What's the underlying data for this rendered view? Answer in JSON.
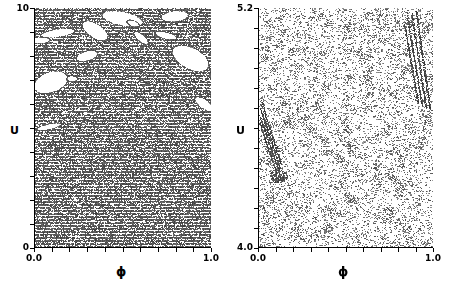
{
  "figure": {
    "width": 451,
    "height": 292,
    "background": "#ffffff",
    "ink_color": "#000000",
    "panel_count": 2
  },
  "chart_data": [
    {
      "id": "left-panel",
      "type": "scatter",
      "title": "",
      "xlabel": "ϕ",
      "ylabel": "U",
      "xlim": [
        0.0,
        1.0
      ],
      "ylim": [
        0.0,
        10.0
      ],
      "xticklabels": [
        "0.0",
        "1.0"
      ],
      "yticklabels": [
        "0",
        "10"
      ],
      "x_major_ticks": 11,
      "y_major_ticks": 11,
      "grid": false,
      "legend": null,
      "point_color": "#595959",
      "density": "dense chaotic sea with horizontal striation texture",
      "point_count": 26000,
      "stripe_period_px": 3,
      "voids": [
        {
          "cx": 0.5,
          "cy": 0.955,
          "rx": 0.115,
          "ry": 0.028,
          "rot": -8
        },
        {
          "cx": 0.795,
          "cy": 0.965,
          "rx": 0.075,
          "ry": 0.022,
          "rot": 4
        },
        {
          "cx": 0.345,
          "cy": 0.905,
          "rx": 0.075,
          "ry": 0.03,
          "rot": -22
        },
        {
          "cx": 0.135,
          "cy": 0.895,
          "rx": 0.095,
          "ry": 0.016,
          "rot": 6
        },
        {
          "cx": 0.035,
          "cy": 0.865,
          "rx": 0.055,
          "ry": 0.013,
          "rot": 2
        },
        {
          "cx": 0.605,
          "cy": 0.875,
          "rx": 0.045,
          "ry": 0.016,
          "rot": -30
        },
        {
          "cx": 0.745,
          "cy": 0.885,
          "rx": 0.06,
          "ry": 0.014,
          "rot": -10
        },
        {
          "cx": 0.3,
          "cy": 0.8,
          "rx": 0.06,
          "ry": 0.02,
          "rot": 10
        },
        {
          "cx": 0.885,
          "cy": 0.79,
          "rx": 0.105,
          "ry": 0.045,
          "rot": -18
        },
        {
          "cx": 0.095,
          "cy": 0.69,
          "rx": 0.095,
          "ry": 0.042,
          "rot": 12
        },
        {
          "cx": 0.215,
          "cy": 0.705,
          "rx": 0.03,
          "ry": 0.012,
          "rot": 0
        },
        {
          "cx": 0.96,
          "cy": 0.6,
          "rx": 0.055,
          "ry": 0.02,
          "rot": -25
        },
        {
          "cx": 0.085,
          "cy": 0.505,
          "rx": 0.07,
          "ry": 0.011,
          "rot": 9
        },
        {
          "cx": 0.56,
          "cy": 0.935,
          "rx": 0.035,
          "ry": 0.012,
          "rot": -14
        }
      ],
      "description": "Chaotic phase-space scatter; dense gray sea spanning full width, punctuated by white regular islands concentrated in the upper third."
    },
    {
      "id": "right-panel",
      "type": "scatter",
      "title": "",
      "xlabel": "ϕ",
      "ylabel": "U",
      "xlim": [
        0.0,
        1.0
      ],
      "ylim": [
        4.0,
        5.2
      ],
      "xticklabels": [
        "0.0",
        "1.0"
      ],
      "yticklabels": [
        "4.0",
        "5.2"
      ],
      "x_major_ticks": 11,
      "y_major_ticks": 13,
      "grid": false,
      "legend": null,
      "point_color": "#6e6e6e",
      "density": "sparse speckled scatter with diagonal filament streaks",
      "point_count": 7000,
      "streaks": [
        {
          "x0": 0.905,
          "y0": 0.985,
          "x1": 0.985,
          "y1": 0.575,
          "w": 1.0
        },
        {
          "x0": 0.88,
          "y0": 0.975,
          "x1": 0.962,
          "y1": 0.58,
          "w": 0.9
        },
        {
          "x0": 0.855,
          "y0": 0.96,
          "x1": 0.94,
          "y1": 0.59,
          "w": 0.8
        },
        {
          "x0": 0.838,
          "y0": 0.93,
          "x1": 0.918,
          "y1": 0.6,
          "w": 0.7
        },
        {
          "x0": 0.02,
          "y0": 0.61,
          "x1": 0.135,
          "y1": 0.345,
          "w": 1.0
        },
        {
          "x0": 0.016,
          "y0": 0.58,
          "x1": 0.128,
          "y1": 0.33,
          "w": 0.9
        },
        {
          "x0": 0.012,
          "y0": 0.552,
          "x1": 0.12,
          "y1": 0.318,
          "w": 0.8
        },
        {
          "x0": 0.01,
          "y0": 0.522,
          "x1": 0.11,
          "y1": 0.305,
          "w": 0.7
        }
      ],
      "clusters": [
        {
          "cx": 0.12,
          "cy": 0.3,
          "rx": 0.05,
          "ry": 0.03
        }
      ],
      "description": "Magnified view of the chaotic sea between U = 4.0 and U = 5.2; uniform speckle with faint diagonal invariant-manifold filaments at upper right and mid left."
    }
  ],
  "panels": {
    "left": {
      "y_axis_title": "U",
      "x_axis_title": "ϕ",
      "y_top_label": "10",
      "y_bottom_label": "0",
      "x_left_label": "0.0",
      "x_right_label": "1.0"
    },
    "right": {
      "y_axis_title": "U",
      "x_axis_title": "ϕ",
      "y_top_label": "5.2",
      "y_bottom_label": "4.0",
      "x_left_label": "0.0",
      "x_right_label": "1.0"
    }
  }
}
